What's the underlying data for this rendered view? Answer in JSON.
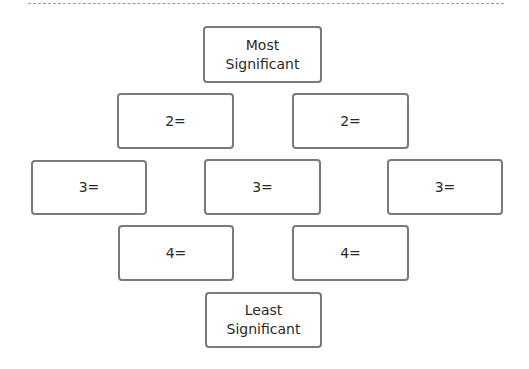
{
  "diagram": {
    "type": "diamond-ranking",
    "top": {
      "label": "Most\nSignificant"
    },
    "row2": [
      {
        "label": "2="
      },
      {
        "label": "2="
      }
    ],
    "row3": [
      {
        "label": "3="
      },
      {
        "label": "3="
      },
      {
        "label": "3="
      }
    ],
    "row4": [
      {
        "label": "4="
      },
      {
        "label": "4="
      }
    ],
    "bottom": {
      "label": "Least\nSignificant"
    }
  },
  "colors": {
    "border": "#7a7a7a",
    "text": "#2a2a2a",
    "background": "#ffffff",
    "dashed_rule": "#9a9a9a"
  }
}
